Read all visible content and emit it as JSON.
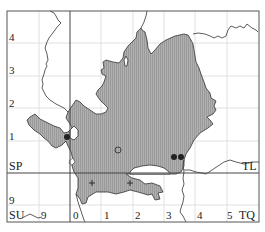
{
  "map": {
    "type": "distribution-map",
    "grid_squares": [
      {
        "label": "SP",
        "position": "left-upper"
      },
      {
        "label": "SU",
        "position": "left-lower"
      },
      {
        "label": "TL",
        "position": "right-upper"
      },
      {
        "label": "TQ",
        "position": "right-lower"
      }
    ],
    "left_axis_labels": [
      "4",
      "3",
      "2",
      "1",
      "9"
    ],
    "bottom_axis_labels": [
      "9",
      "0",
      "1",
      "2",
      "3",
      "4",
      "5"
    ],
    "colors": {
      "shaded_region": "#a8a8a8",
      "region_outline": "#333333",
      "frame": "#555555",
      "major_grid": "#444444",
      "minor_grid": "#dddddd",
      "marker": "#222222"
    },
    "markers": [
      {
        "type": "filled-dot",
        "x": 67,
        "y": 137
      },
      {
        "type": "open-circle",
        "x": 118,
        "y": 150
      },
      {
        "type": "filled-dot",
        "x": 174,
        "y": 157
      },
      {
        "type": "filled-dot",
        "x": 181,
        "y": 157
      },
      {
        "type": "plus",
        "x": 92,
        "y": 183
      },
      {
        "type": "plus",
        "x": 130,
        "y": 183
      }
    ]
  }
}
